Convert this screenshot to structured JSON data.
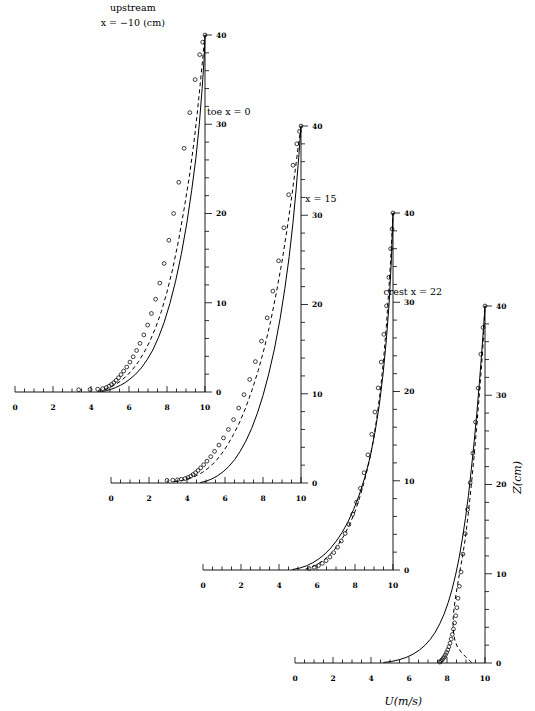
{
  "figure": {
    "xlabel": "U(m/s)",
    "ylabel": "Z(cm)",
    "x_ticks": [
      0,
      2,
      4,
      6,
      8,
      10
    ],
    "x_tick_labels": [
      "0",
      "2",
      "4",
      "6",
      "8",
      "10"
    ],
    "y_ticks": [
      0,
      10,
      20,
      30,
      40
    ],
    "y_tick_labels": [
      "0",
      "10",
      "20",
      "30",
      "40"
    ],
    "xlim": [
      0,
      10
    ],
    "ylim": [
      0,
      40
    ],
    "x_minor_step": 0.5,
    "y_minor_step": 2
  },
  "chart_data": {
    "type": "line",
    "title": "",
    "xlabel": "U(m/s)",
    "ylabel": "Z(cm)",
    "xlim": [
      0,
      10
    ],
    "ylim": [
      0,
      40
    ],
    "grid": false,
    "legend": "none",
    "series_kinds": [
      "solid-line",
      "dashed-line",
      "open-circle-markers"
    ],
    "panels": [
      {
        "id": "panel-upstream",
        "title_line1": "upstream",
        "title_line2": "x = −10 (cm)",
        "origin_px": [
          15,
          392
        ],
        "series": [
          {
            "name": "model-solid",
            "style": "solid",
            "x": [
              4.55,
              4.8,
              5.05,
              5.3,
              5.55,
              5.8,
              6.05,
              6.35,
              6.65,
              6.95,
              7.25,
              7.55,
              7.85,
              8.15,
              8.45,
              8.75,
              9.05,
              9.3,
              9.52,
              9.7,
              9.85,
              9.95,
              10.0
            ],
            "y": [
              0.05,
              0.15,
              0.3,
              0.5,
              0.75,
              1.05,
              1.45,
              2.0,
              2.7,
              3.6,
              4.7,
              6.1,
              7.8,
              9.9,
              12.4,
              15.4,
              19.0,
              22.6,
              26.2,
              30.0,
              34.0,
              37.2,
              40.0
            ]
          },
          {
            "name": "model-dashed",
            "style": "dashed",
            "x": [
              4.35,
              4.6,
              4.85,
              5.1,
              5.35,
              5.6,
              5.9,
              6.2,
              6.5,
              6.8,
              7.1,
              7.4,
              7.7,
              8.0,
              8.3,
              8.6,
              8.9,
              9.18,
              9.42,
              9.62,
              9.78,
              9.9,
              10.0
            ],
            "y": [
              0.05,
              0.18,
              0.38,
              0.62,
              0.92,
              1.3,
              1.85,
              2.55,
              3.4,
              4.45,
              5.7,
              7.2,
              9.0,
              11.2,
              13.8,
              16.9,
              20.5,
              24.2,
              28.0,
              31.8,
              35.2,
              37.8,
              40.0
            ]
          },
          {
            "name": "measured-points",
            "style": "circles",
            "x": [
              3.35,
              3.95,
              4.35,
              4.62,
              4.8,
              4.95,
              5.08,
              5.2,
              5.32,
              5.45,
              5.58,
              5.72,
              5.88,
              6.05,
              6.22,
              6.4,
              6.58,
              6.78,
              6.98,
              7.18,
              7.4,
              7.62,
              7.85,
              8.1,
              8.35,
              8.62,
              8.9,
              9.2,
              9.48,
              9.72,
              9.88,
              10.0
            ],
            "y": [
              0.25,
              0.28,
              0.32,
              0.38,
              0.5,
              0.65,
              0.85,
              1.05,
              1.3,
              1.6,
              1.95,
              2.35,
              2.8,
              3.35,
              3.95,
              4.65,
              5.45,
              6.4,
              7.5,
              8.8,
              10.4,
              12.2,
              14.4,
              17.0,
              20.0,
              23.5,
              27.3,
              31.3,
              35.0,
              37.8,
              39.2,
              40.0
            ]
          }
        ]
      },
      {
        "id": "panel-toe",
        "title_line1": "toe x = 0",
        "title_line2": "",
        "origin_px": [
          111,
          483
        ],
        "series": [
          {
            "name": "model-solid",
            "style": "solid",
            "x": [
              4.7,
              5.0,
              5.3,
              5.6,
              5.9,
              6.2,
              6.5,
              6.8,
              7.1,
              7.4,
              7.7,
              8.0,
              8.3,
              8.6,
              8.9,
              9.15,
              9.38,
              9.58,
              9.74,
              9.88,
              10.0
            ],
            "y": [
              0.05,
              0.2,
              0.45,
              0.8,
              1.25,
              1.85,
              2.6,
              3.55,
              4.7,
              6.1,
              7.8,
              9.8,
              12.2,
              15.0,
              18.4,
              21.8,
              25.4,
              29.2,
              32.8,
              36.5,
              40.0
            ]
          },
          {
            "name": "model-dashed",
            "style": "dashed",
            "x": [
              3.3,
              3.7,
              4.05,
              4.35,
              4.65,
              4.95,
              5.25,
              5.55,
              5.85,
              6.15,
              6.45,
              6.78,
              7.1,
              7.42,
              7.75,
              8.08,
              8.4,
              8.7,
              9.0,
              9.25,
              9.48,
              9.68,
              9.85,
              10.0
            ],
            "y": [
              0.15,
              0.28,
              0.45,
              0.68,
              0.98,
              1.38,
              1.9,
              2.55,
              3.35,
              4.3,
              5.45,
              6.85,
              8.5,
              10.4,
              12.6,
              15.2,
              18.1,
              21.3,
              24.8,
              28.2,
              31.6,
              34.8,
              37.6,
              40.0
            ]
          },
          {
            "name": "measured-points",
            "style": "circles",
            "x": [
              2.95,
              3.25,
              3.5,
              3.7,
              3.9,
              4.05,
              4.2,
              4.32,
              4.45,
              4.58,
              4.72,
              4.88,
              5.05,
              5.25,
              5.45,
              5.68,
              5.92,
              6.18,
              6.45,
              6.72,
              7.0,
              7.3,
              7.6,
              7.92,
              8.22,
              8.52,
              8.82,
              9.1,
              9.35,
              9.58,
              9.78,
              9.92,
              10.0
            ],
            "y": [
              0.3,
              0.32,
              0.36,
              0.42,
              0.5,
              0.62,
              0.78,
              0.95,
              1.15,
              1.4,
              1.7,
              2.05,
              2.45,
              2.95,
              3.55,
              4.25,
              5.05,
              6.0,
              7.1,
              8.4,
              9.9,
              11.6,
              13.6,
              15.9,
              18.5,
              21.5,
              24.9,
              28.6,
              32.3,
              35.6,
              38.0,
              39.4,
              40.0
            ]
          }
        ]
      },
      {
        "id": "panel-x15",
        "title_line1": "x = 15",
        "title_line2": "",
        "origin_px": [
          203,
          570
        ],
        "series": [
          {
            "name": "model-solid",
            "style": "solid",
            "x": [
              4.7,
              5.1,
              5.45,
              5.78,
              6.1,
              6.42,
              6.72,
              7.02,
              7.32,
              7.62,
              7.92,
              8.22,
              8.52,
              8.8,
              9.05,
              9.28,
              9.48,
              9.65,
              9.8,
              9.92,
              10.0
            ],
            "y": [
              0.05,
              0.22,
              0.48,
              0.82,
              1.25,
              1.8,
              2.45,
              3.25,
              4.2,
              5.35,
              6.75,
              8.4,
              10.4,
              12.7,
              15.4,
              18.5,
              22.0,
              25.8,
              30.0,
              35.0,
              40.0
            ]
          },
          {
            "name": "model-dashed",
            "style": "dashed",
            "x": [
              5.4,
              5.72,
              6.02,
              6.32,
              6.6,
              6.88,
              7.15,
              7.42,
              7.68,
              7.95,
              8.2,
              8.45,
              8.7,
              8.93,
              9.14,
              9.33,
              9.5,
              9.65,
              9.78,
              9.9,
              10.0
            ],
            "y": [
              0.1,
              0.32,
              0.65,
              1.05,
              1.55,
              2.18,
              2.95,
              3.85,
              4.95,
              6.25,
              7.8,
              9.6,
              11.7,
              14.1,
              16.9,
              20.0,
              23.5,
              27.3,
              31.4,
              35.6,
              40.0
            ]
          },
          {
            "name": "measured-points",
            "style": "circles",
            "x": [
              5.58,
              5.85,
              6.08,
              6.28,
              6.48,
              6.68,
              6.88,
              7.08,
              7.28,
              7.48,
              7.68,
              7.88,
              8.08,
              8.28,
              8.48,
              8.68,
              8.88,
              9.05,
              9.22,
              9.38,
              9.52,
              9.66,
              9.78,
              9.88,
              9.95,
              10.0
            ],
            "y": [
              0.18,
              0.3,
              0.5,
              0.75,
              1.05,
              1.45,
              1.95,
              2.55,
              3.25,
              4.1,
              5.1,
              6.25,
              7.6,
              9.15,
              10.9,
              12.9,
              15.2,
              17.7,
              20.4,
              23.3,
              26.4,
              29.6,
              32.8,
              36.0,
              38.2,
              40.0
            ]
          }
        ]
      },
      {
        "id": "panel-crest",
        "title_line1": "crest x = 22",
        "title_line2": "",
        "origin_px": [
          295,
          663
        ],
        "series": [
          {
            "name": "model-solid",
            "style": "solid",
            "x": [
              4.65,
              5.1,
              5.5,
              5.88,
              6.22,
              6.55,
              6.85,
              7.12,
              7.38,
              7.62,
              7.85,
              8.06,
              8.26,
              8.45,
              8.63,
              8.8,
              8.97,
              9.13,
              9.28,
              9.43,
              9.57,
              9.7,
              9.82,
              9.92,
              10.0
            ],
            "y": [
              0.05,
              0.18,
              0.38,
              0.65,
              1.0,
              1.45,
              2.0,
              2.65,
              3.45,
              4.4,
              5.5,
              6.75,
              8.2,
              9.85,
              11.7,
              13.8,
              16.2,
              18.8,
              21.7,
              24.8,
              28.0,
              31.3,
              34.6,
              37.5,
              40.0
            ]
          },
          {
            "name": "model-dashed",
            "style": "dashed",
            "x": [
              9.3,
              9.18,
              8.98,
              8.75,
              8.55,
              8.42,
              8.35,
              8.32,
              8.33,
              8.38,
              8.46,
              8.56,
              8.68,
              8.82,
              8.96,
              9.08,
              9.2,
              9.32,
              9.44,
              9.56,
              9.68,
              9.8,
              9.9,
              9.96,
              10.0
            ],
            "y": [
              0.05,
              0.3,
              0.7,
              1.2,
              1.8,
              2.5,
              3.3,
              4.2,
              5.2,
              6.3,
              7.5,
              8.8,
              10.3,
              12.0,
              13.9,
              16.0,
              18.3,
              20.8,
              23.5,
              26.4,
              29.5,
              32.8,
              35.8,
              38.2,
              40.0
            ]
          },
          {
            "name": "measured-points",
            "style": "circles",
            "x": [
              7.62,
              7.68,
              7.74,
              7.8,
              7.86,
              7.92,
              7.98,
              8.04,
              8.1,
              8.16,
              8.22,
              8.28,
              8.34,
              8.4,
              8.46,
              8.52,
              8.58,
              8.65,
              8.74,
              8.84,
              8.96,
              9.08,
              9.22,
              9.36,
              9.5,
              9.64,
              9.78,
              9.9,
              10.0
            ],
            "y": [
              0.1,
              0.22,
              0.36,
              0.52,
              0.7,
              0.92,
              1.18,
              1.48,
              1.82,
              2.22,
              2.68,
              3.2,
              3.8,
              4.5,
              5.3,
              6.2,
              7.25,
              8.6,
              10.2,
              12.2,
              14.5,
              17.2,
              20.2,
              23.5,
              27.0,
              30.8,
              34.6,
              37.6,
              40.0
            ]
          }
        ]
      }
    ]
  }
}
